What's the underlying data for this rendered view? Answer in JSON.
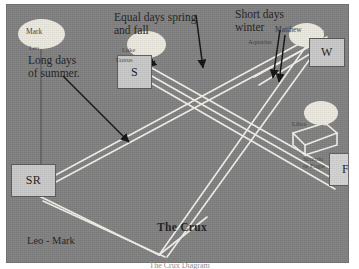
{
  "figure": {
    "title": "The Crux",
    "caption": "The Crux Diagram"
  },
  "boxes": [
    {
      "id": "s",
      "label": "S",
      "name": "summer-solstice-box"
    },
    {
      "id": "w",
      "label": "W",
      "name": "winter-solstice-box"
    },
    {
      "id": "sr",
      "label": "SR",
      "name": "sunrise-box"
    },
    {
      "id": "f",
      "label": "F",
      "name": "fall-box"
    }
  ],
  "annotations": {
    "equal_days": "Equal days spring\nand fall",
    "short_days": "Short days\nwinter",
    "long_days": "Long days\nof summer.",
    "crux": "The Crux",
    "leo_mark": "Leo - Mark"
  },
  "small_labels": {
    "mark": "Mark",
    "leo": "Leo",
    "luke": "Luke",
    "taurus": "Taurus",
    "matthew": "Matthew",
    "aquarius": "Aquarius",
    "libra": "Libra",
    "scorpio": "Scorpio\nor Eagle"
  },
  "colors": {
    "plate_background": "#808080",
    "box_fill": "#c9c9c9",
    "box_border": "#5a5a5a",
    "line": "#f2f0e8",
    "arrow": "#111111",
    "sun_fill": "#eceadf",
    "text": "#20201f"
  },
  "diagram_data": {
    "type": "diagram",
    "description": "Hand-drawn astronomical perspective diagram showing solstice and equinox sun paths crossing at a point called The Crux",
    "markers": [
      "S",
      "W",
      "SR",
      "F"
    ],
    "arrow_count": 4,
    "sun_count": 4,
    "line_style": "white perspective lines on grey background"
  }
}
